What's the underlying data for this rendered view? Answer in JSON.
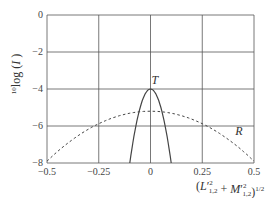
{
  "chart_data": {
    "type": "line",
    "title": "",
    "xlabel": "(L'²₁,₂ + M'²₁,₂)^1/2",
    "ylabel": "¹⁰log(I)",
    "xlim": [
      -0.5,
      0.5
    ],
    "ylim": [
      -8,
      0
    ],
    "grid": true,
    "x_ticks": [
      "-0.5",
      "-0.25",
      "0",
      "0.25",
      "0.5"
    ],
    "y_ticks": [
      "0",
      "-2",
      "-4",
      "-6",
      "-8"
    ],
    "series": [
      {
        "name": "T",
        "style": "solid",
        "x": [
          -0.1,
          -0.075,
          -0.05,
          -0.025,
          0,
          0.025,
          0.05,
          0.075,
          0.1
        ],
        "values": [
          -8,
          -6.3,
          -5.0,
          -4.25,
          -4.0,
          -4.25,
          -5.0,
          -6.3,
          -8
        ]
      },
      {
        "name": "R",
        "style": "dashed",
        "x": [
          -0.5,
          -0.375,
          -0.25,
          -0.125,
          0,
          0.125,
          0.25,
          0.375,
          0.5
        ],
        "values": [
          -7.9,
          -6.8,
          -5.9,
          -5.35,
          -5.2,
          -5.35,
          -5.9,
          -6.8,
          -7.9
        ]
      }
    ],
    "annotations": [
      "T",
      "R"
    ]
  },
  "labels": {
    "ylabel_prefix": "10",
    "ylabel_main": "log (",
    "ylabel_var": "I",
    "ylabel_close": ")",
    "xlabel_text": "(L",
    "curve_T": "T",
    "curve_R": "R"
  }
}
